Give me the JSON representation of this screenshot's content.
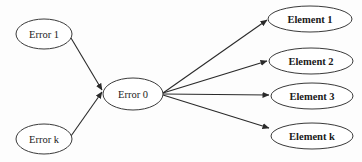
{
  "diagram": {
    "type": "directed-graph",
    "nodes": [
      {
        "id": "error1",
        "label": "Error 1",
        "bold": false
      },
      {
        "id": "errork",
        "label": "Error k",
        "bold": false
      },
      {
        "id": "error0",
        "label": "Error 0",
        "bold": false
      },
      {
        "id": "element1",
        "label": "Element 1",
        "bold": true
      },
      {
        "id": "element2",
        "label": "Element 2",
        "bold": true
      },
      {
        "id": "element3",
        "label": "Element 3",
        "bold": true
      },
      {
        "id": "elementk",
        "label": "Element k",
        "bold": true
      }
    ],
    "edges": [
      {
        "from": "error1",
        "to": "error0"
      },
      {
        "from": "errork",
        "to": "error0"
      },
      {
        "from": "error0",
        "to": "element1"
      },
      {
        "from": "error0",
        "to": "element2"
      },
      {
        "from": "error0",
        "to": "element3"
      },
      {
        "from": "error0",
        "to": "elementk"
      }
    ]
  }
}
